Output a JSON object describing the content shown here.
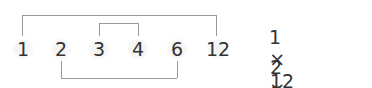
{
  "factors": [
    {
      "value": "1",
      "x": 22
    },
    {
      "value": "2",
      "x": 61
    },
    {
      "value": "3",
      "x": 99
    },
    {
      "value": "4",
      "x": 138
    },
    {
      "value": "6",
      "x": 177
    },
    {
      "value": "12",
      "x": 216
    }
  ],
  "pairs": [
    {
      "a": "1",
      "b": "12",
      "side": "top-outer"
    },
    {
      "a": "3",
      "b": "4",
      "side": "top-inner"
    },
    {
      "a": "2",
      "b": "6",
      "side": "bottom"
    }
  ],
  "equations": [
    {
      "a": "1",
      "op": "×",
      "b": "12",
      "eq": "=",
      "result": "12"
    },
    {
      "a": "2",
      "op": "×",
      "b": "6",
      "eq": "=",
      "result": "12"
    },
    {
      "a": "3",
      "op": "×",
      "b": "4",
      "eq": "=",
      "result": "12"
    }
  ],
  "colors": {
    "text": "#333333",
    "lines": "#999999"
  }
}
